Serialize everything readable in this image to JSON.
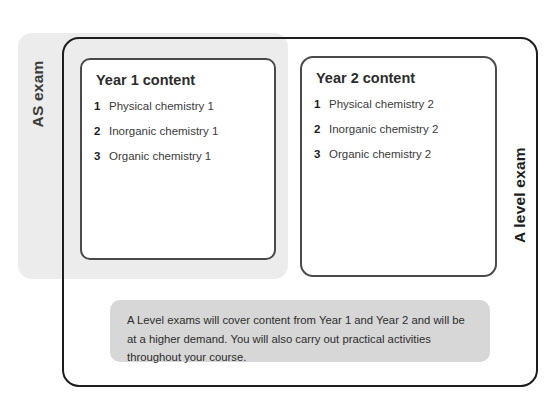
{
  "diagram": {
    "as_exam": {
      "label": "AS exam"
    },
    "a_level_exam": {
      "label": "A level exam"
    },
    "panels": [
      {
        "title": "Year 1 content",
        "items": [
          {
            "number": "1",
            "text": "Physical chemistry 1"
          },
          {
            "number": "2",
            "text": "Inorganic chemistry 1"
          },
          {
            "number": "3",
            "text": "Organic chemistry 1"
          }
        ]
      },
      {
        "title": "Year 2 content",
        "items": [
          {
            "number": "1",
            "text": "Physical chemistry 2"
          },
          {
            "number": "2",
            "text": "Inorganic chemistry 2"
          },
          {
            "number": "3",
            "text": "Organic chemistry 2"
          }
        ]
      }
    ],
    "note": {
      "text": "A Level exams will cover content from Year 1 and Year 2 and will be at a higher demand. You will also carry out practical activities throughout your course."
    },
    "colors": {
      "as_exam_fill": "#ececec",
      "note_fill": "#d7d7d7",
      "outer_border": "#1d1d1d",
      "panel_border": "#4a4a4a",
      "text": "#2d2d2d",
      "background": "#ffffff"
    }
  }
}
